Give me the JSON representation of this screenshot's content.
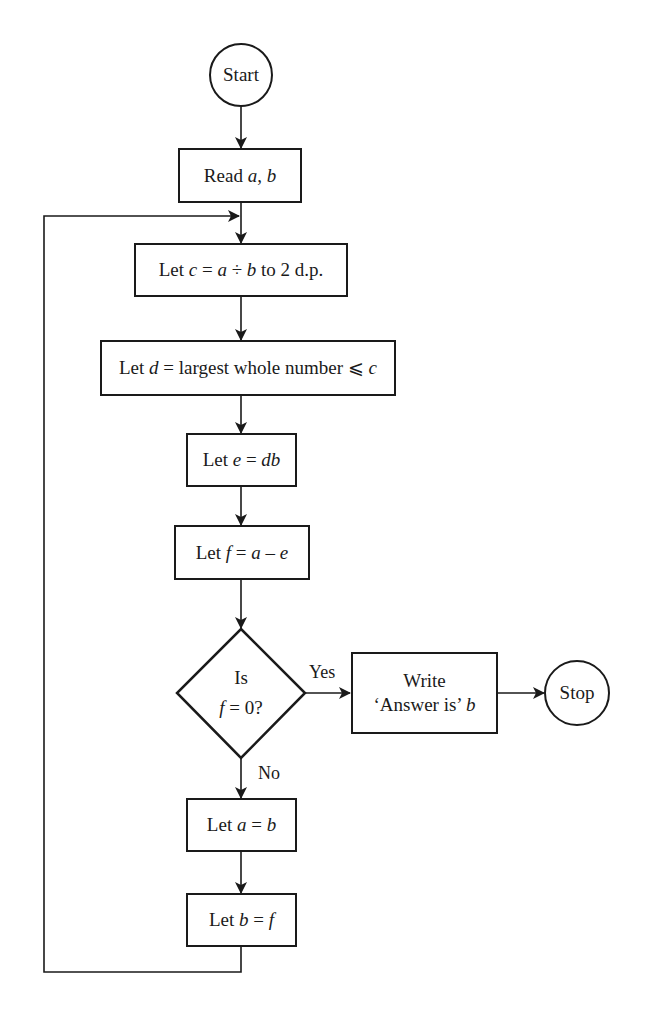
{
  "diagram": {
    "type": "flowchart",
    "nodes": {
      "start": {
        "shape": "circle",
        "label": "Start"
      },
      "read": {
        "shape": "rect",
        "text_a": "Read ",
        "var_a": "a",
        "sep": ", ",
        "var_b": "b"
      },
      "calc_c": {
        "shape": "rect",
        "p1": "Let ",
        "v1": "c",
        "p2": " = ",
        "v2": "a",
        "p3": " ÷ ",
        "v3": "b",
        "p4": " to 2 d.p."
      },
      "calc_d": {
        "shape": "rect",
        "p1": "Let ",
        "v1": "d",
        "p2": " = largest whole number ⩽ ",
        "v2": "c"
      },
      "calc_e": {
        "shape": "rect",
        "p1": "Let ",
        "v1": "e",
        "p2": " = ",
        "v2": "db"
      },
      "calc_f": {
        "shape": "rect",
        "p1": "Let ",
        "v1": "f",
        "p2": " = ",
        "v2": "a",
        "p3": " – ",
        "v3": "e"
      },
      "decision": {
        "shape": "diamond",
        "line1": "Is",
        "v1": "f",
        "line2": " = 0?"
      },
      "write": {
        "shape": "rect",
        "line1": "Write",
        "line2": "‘Answer is’ ",
        "v1": "b"
      },
      "stop": {
        "shape": "circle",
        "label": "Stop"
      },
      "set_a": {
        "shape": "rect",
        "p1": "Let ",
        "v1": "a",
        "p2": " = ",
        "v2": "b"
      },
      "set_b": {
        "shape": "rect",
        "p1": "Let ",
        "v1": "b",
        "p2": " = ",
        "v2": "f"
      }
    },
    "edge_labels": {
      "yes": "Yes",
      "no": "No"
    },
    "edges": [
      [
        "start",
        "read"
      ],
      [
        "read",
        "calc_c"
      ],
      [
        "calc_c",
        "calc_d"
      ],
      [
        "calc_d",
        "calc_e"
      ],
      [
        "calc_e",
        "calc_f"
      ],
      [
        "calc_f",
        "decision"
      ],
      [
        "decision",
        "write",
        "Yes"
      ],
      [
        "write",
        "stop"
      ],
      [
        "decision",
        "set_a",
        "No"
      ],
      [
        "set_a",
        "set_b"
      ],
      [
        "set_b",
        "calc_c",
        "loop"
      ]
    ],
    "colors": {
      "stroke": "#1a1a1a",
      "background": "#ffffff"
    }
  }
}
